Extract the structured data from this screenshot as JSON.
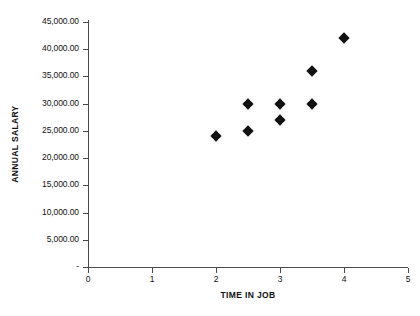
{
  "chart_data": {
    "type": "scatter",
    "title": "",
    "xlabel": "TIME IN JOB",
    "ylabel": "ANNUAL SALARY",
    "xlim": [
      0,
      5
    ],
    "ylim": [
      0,
      45000
    ],
    "grid": false,
    "legend": null,
    "x_ticks": [
      "0",
      "1",
      "2",
      "3",
      "4",
      "5"
    ],
    "x_tick_values": [
      0,
      1,
      2,
      3,
      4,
      5
    ],
    "y_ticks": [
      "-",
      "5,000.00",
      "10,000.00",
      "15,000.00",
      "20,000.00",
      "25,000.00",
      "30,000.00",
      "35,000.00",
      "40,000.00",
      "45,000.00"
    ],
    "y_tick_values": [
      0,
      5000,
      10000,
      15000,
      20000,
      25000,
      30000,
      35000,
      40000,
      45000
    ],
    "marker": "diamond",
    "marker_color": "#111111",
    "points": [
      {
        "x": 2.0,
        "y": 24000
      },
      {
        "x": 2.5,
        "y": 30000
      },
      {
        "x": 2.5,
        "y": 25000
      },
      {
        "x": 3.0,
        "y": 30000
      },
      {
        "x": 3.0,
        "y": 27000
      },
      {
        "x": 3.5,
        "y": 36000
      },
      {
        "x": 3.5,
        "y": 30000
      },
      {
        "x": 4.0,
        "y": 42000
      }
    ]
  }
}
